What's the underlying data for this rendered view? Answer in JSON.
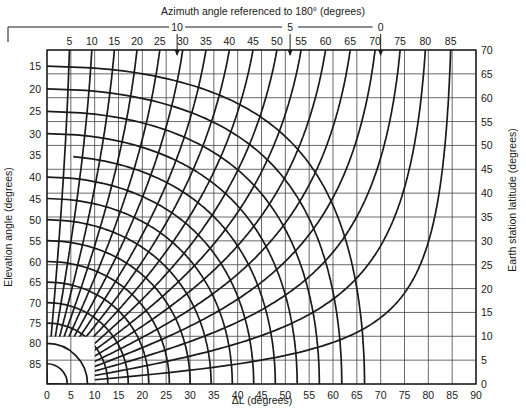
{
  "chart_data": {
    "type": "line",
    "title": "Azimuth angle referenced to 180° (degrees)",
    "xlabel": "ΔL (degrees)",
    "ylabel_left": "Elevation angle (degrees)",
    "ylabel_right": "Earth station latitude (degrees)",
    "x_axis": {
      "range": [
        0,
        90
      ],
      "ticks": [
        0,
        5,
        10,
        15,
        20,
        25,
        30,
        35,
        40,
        45,
        50,
        55,
        60,
        65,
        70,
        75,
        80,
        85,
        90
      ]
    },
    "right_axis": {
      "range": [
        0,
        70
      ],
      "ticks": [
        0,
        5,
        10,
        15,
        20,
        25,
        30,
        35,
        40,
        45,
        50,
        55,
        60,
        65,
        70
      ]
    },
    "left_axis_elevation_ticks": [
      15,
      20,
      25,
      30,
      35,
      40,
      45,
      50,
      55,
      60,
      65,
      70,
      75,
      80,
      85
    ],
    "top_axis_azimuth_ticks": [
      5,
      10,
      15,
      20,
      25,
      30,
      35,
      40,
      45,
      50,
      55,
      60,
      65,
      70,
      75,
      80,
      85
    ],
    "top_axis_azimuth_markers": [
      {
        "label": "10",
        "at_x_deg": 27.3
      },
      {
        "label": "5",
        "at_x_deg": 51.0
      },
      {
        "label": "0",
        "at_x_deg": 70.0
      }
    ],
    "series": [
      {
        "name": "constant elevation curves",
        "values_deg": [
          15,
          20,
          25,
          30,
          35,
          40,
          45,
          50,
          55,
          60,
          65,
          70,
          75,
          80,
          85
        ]
      },
      {
        "name": "constant azimuth curves",
        "values_deg": [
          5,
          10,
          15,
          20,
          25,
          30,
          35,
          40,
          45,
          50,
          55,
          60,
          65,
          70,
          75,
          80,
          85
        ]
      }
    ],
    "orbit_radius_earth_radii": 6.62,
    "grid": true,
    "legend": "none"
  },
  "labels": {
    "top_title": "Azimuth angle referenced to 180° (degrees)",
    "bottom_title": "ΔL  (degrees)",
    "left_title": "Elevation angle (degrees)",
    "right_title": "Earth station latitude (degrees)"
  },
  "colors": {
    "ink": "#1a1a1a",
    "grid": "#333333",
    "background": "#ffffff"
  }
}
